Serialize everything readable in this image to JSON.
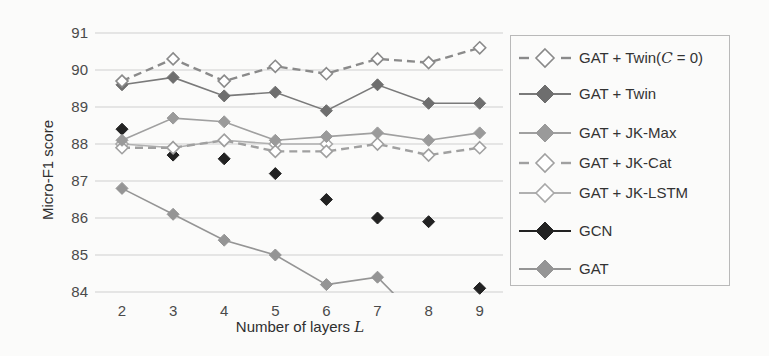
{
  "chart_data": {
    "type": "line",
    "title": "",
    "xlabel": "Number of layers L",
    "xlabel_text": "Number of layers ",
    "xlabel_var": "L",
    "ylabel": "Micro-F1 score",
    "x": [
      2,
      3,
      4,
      5,
      6,
      7,
      8,
      9
    ],
    "x_tick_labels": [
      "2",
      "3",
      "4",
      "5",
      "6",
      "7",
      "8",
      "9"
    ],
    "ylim": [
      84,
      91
    ],
    "y_ticks": [
      84,
      85,
      86,
      87,
      88,
      89,
      90,
      91
    ],
    "y_tick_labels": [
      "84",
      "85",
      "86",
      "87",
      "88",
      "89",
      "90",
      "91"
    ],
    "grid": "horizontal",
    "legend_position": "right",
    "series": [
      {
        "name": "GAT + Twin(C = 0)",
        "label_prefix": "GAT + Twin(",
        "label_var": "C",
        "label_suffix": " = 0)",
        "values": [
          89.7,
          90.3,
          89.7,
          90.1,
          89.9,
          90.3,
          90.2,
          90.6
        ],
        "line": "dashed",
        "marker": "open-diamond",
        "color": "#8a8a8a",
        "marker_color": "#8a8a8a"
      },
      {
        "name": "GAT + Twin",
        "values": [
          89.6,
          89.8,
          89.3,
          89.4,
          88.9,
          89.6,
          89.1,
          89.1
        ],
        "line": "solid",
        "marker": "filled-diamond",
        "color": "#7a7a7a",
        "marker_color": "#6e6e6e"
      },
      {
        "name": "GAT + JK-Max",
        "values": [
          88.1,
          88.7,
          88.6,
          88.1,
          88.2,
          88.3,
          88.1,
          88.3
        ],
        "line": "solid",
        "marker": "filled-diamond",
        "color": "#a0a0a0",
        "marker_color": "#9a9a9a"
      },
      {
        "name": "GAT + JK-Cat",
        "values": [
          87.9,
          87.9,
          88.1,
          87.8,
          87.8,
          88.0,
          87.7,
          87.9
        ],
        "line": "dashed",
        "marker": "open-diamond",
        "color": "#a0a0a0",
        "marker_color": "#a0a0a0"
      },
      {
        "name": "GAT + JK-LSTM",
        "values": [
          88.0,
          87.9,
          88.1,
          88.0,
          88.0,
          null,
          null,
          null
        ],
        "line": "solid",
        "marker": "open-diamond",
        "color": "#b0b0b0",
        "marker_color": "#a8a8a8"
      },
      {
        "name": "GCN",
        "values": [
          88.4,
          87.7,
          87.6,
          87.2,
          86.5,
          86.0,
          85.9,
          84.1
        ],
        "line": "none",
        "marker": "filled-diamond",
        "color": "#222222",
        "marker_color": "#222222"
      },
      {
        "name": "GAT",
        "values": [
          86.8,
          86.1,
          85.4,
          85.0,
          84.2,
          84.4,
          83.0,
          null
        ],
        "line": "solid",
        "marker": "filled-diamond",
        "color": "#959595",
        "marker_color": "#959595",
        "note": "value at L=8 falls below the plotted y-range (clipped)"
      }
    ]
  }
}
